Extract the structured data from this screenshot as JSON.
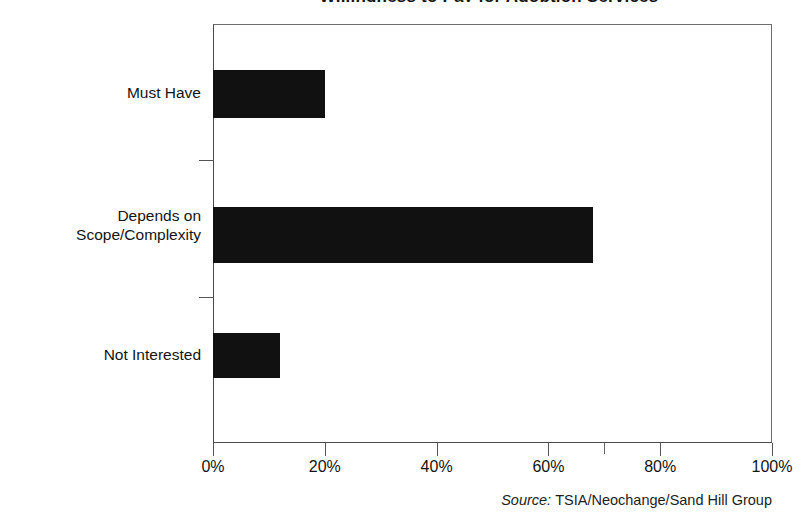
{
  "chart_data": {
    "type": "bar",
    "orientation": "horizontal",
    "title": "Willingness to Pay for Adoption Services",
    "categories": [
      "Must Have",
      "Depends on\nScope/Complexity",
      "Not Interested"
    ],
    "values": [
      20,
      68,
      12
    ],
    "value_suffix": "%",
    "xlabel": "",
    "ylabel": "",
    "xlim": [
      0,
      100
    ],
    "xticks": [
      0,
      20,
      40,
      60,
      80,
      100
    ],
    "xtick_labels": [
      "0%",
      "20%",
      "40%",
      "60%",
      "80%",
      "100%"
    ],
    "minor_xticks": [
      70
    ],
    "grid": false,
    "legend": false,
    "bar_color": "#111111",
    "axis_color": "#4a4a4a",
    "background": "#ffffff",
    "series": [
      {
        "name": "Share of respondents",
        "values": [
          20,
          68,
          12
        ]
      }
    ],
    "annotations": {
      "source_prefix": "Source:",
      "source_text": "TSIA/Neochange/Sand Hill Group"
    }
  }
}
